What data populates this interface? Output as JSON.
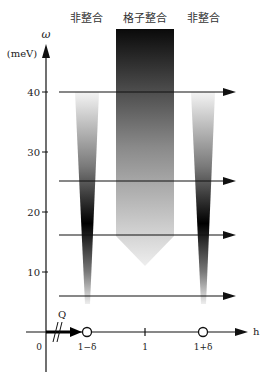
{
  "title_labels": {
    "left": "非整合",
    "center": "格子整合",
    "right": "非整合"
  },
  "y_axis": {
    "symbol": "ω",
    "unit": "(meV)",
    "ticks": [
      "10",
      "20",
      "30",
      "40"
    ]
  },
  "x_axis": {
    "label": "h",
    "origin": "0",
    "ticks": [
      "1−δ",
      "1",
      "1+δ"
    ],
    "vector_label": "Q"
  },
  "energy_lines_meV": [
    40,
    25,
    16,
    6
  ],
  "colors": {
    "line": "#111111",
    "dark": "#000000",
    "light": "#f2f2f2"
  }
}
